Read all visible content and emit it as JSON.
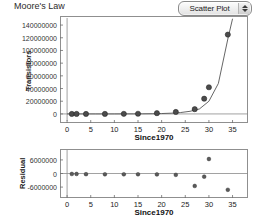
{
  "header": {
    "title": "Moore's Law",
    "plot_type_label": "Scatter Plot",
    "stepper_icon": "up-down-stepper-icon"
  },
  "chart_data": [
    {
      "type": "scatter",
      "id": "main-scatter",
      "title": "Moore's Law",
      "xlabel": "Since1970",
      "ylabel": "Transistors",
      "xlim": [
        -1.5,
        37
      ],
      "ylim": [
        -8000000,
        148000000
      ],
      "xticks": [
        0,
        5,
        10,
        15,
        20,
        25,
        30,
        35
      ],
      "xticklabels": [
        "0",
        "5",
        "10",
        "15",
        "20",
        "25",
        "30",
        "35"
      ],
      "yticks": [
        0,
        20000000,
        40000000,
        60000000,
        80000000,
        100000000,
        120000000,
        140000000
      ],
      "yticklabels": [
        "0",
        "20000000",
        "40000000",
        "60000000",
        "80000000",
        "100000000",
        "120000000",
        "140000000"
      ],
      "grid": false,
      "legend": "none",
      "x": [
        1,
        2,
        4,
        8,
        12,
        15,
        19,
        23,
        27,
        29,
        30,
        34
      ],
      "y": [
        2300,
        4500,
        6000,
        29000,
        134000,
        275000,
        1200000,
        3100000,
        7500000,
        24000000,
        42000000,
        125000000
      ],
      "fit": {
        "label": "exponential fit",
        "x": [
          0,
          2,
          4,
          6,
          8,
          10,
          12,
          14,
          16,
          18,
          20,
          22,
          24,
          26,
          28,
          30,
          32,
          34,
          35
        ],
        "y": [
          1000,
          1900,
          3600,
          6800,
          13000,
          25000,
          47000,
          89000,
          170000,
          320000,
          600000,
          1150000,
          2180000,
          4130000,
          7830000,
          20000000,
          48000000,
          118000000,
          150000000
        ]
      }
    },
    {
      "type": "scatter",
      "id": "residual-scatter",
      "title": "",
      "xlabel": "Since1970",
      "ylabel": "Residual",
      "xlim": [
        -1.5,
        37
      ],
      "ylim": [
        -9500000,
        9500000
      ],
      "xticks": [
        0,
        5,
        10,
        15,
        20,
        25,
        30,
        35
      ],
      "xticklabels": [
        "0",
        "5",
        "10",
        "15",
        "20",
        "25",
        "30",
        "35"
      ],
      "yticks": [
        -6000000,
        0,
        6000000
      ],
      "yticklabels": [
        "-6000000",
        "0",
        "6000000"
      ],
      "grid": false,
      "legend": "none",
      "zero_reference_line": 0,
      "x": [
        1,
        2,
        4,
        8,
        12,
        15,
        19,
        23,
        27,
        29,
        30,
        34
      ],
      "y": [
        -200000,
        -200000,
        -300000,
        -350000,
        -350000,
        -350000,
        -400000,
        -600000,
        -5500000,
        -1400000,
        6400000,
        -7200000
      ]
    }
  ]
}
